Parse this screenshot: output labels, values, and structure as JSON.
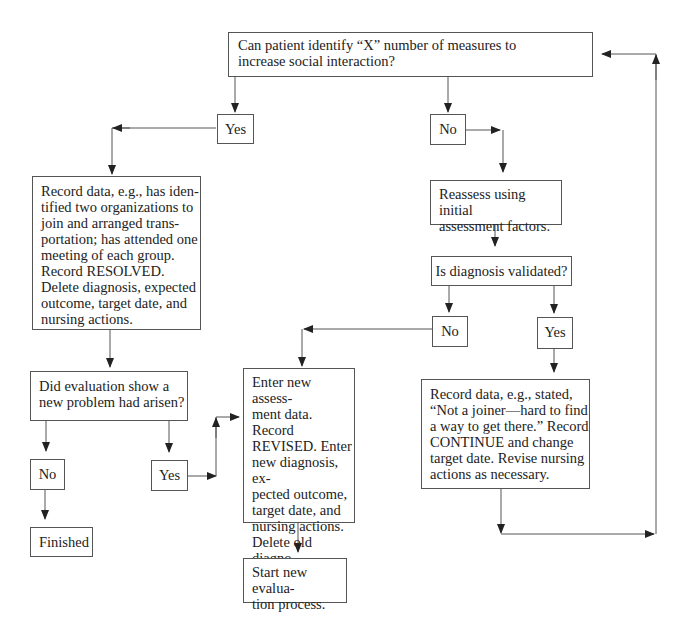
{
  "flowchart": {
    "nodes": {
      "q_identify": {
        "lines": [
          "Can patient identify “X” number of measures to",
          "increase social interaction?"
        ]
      },
      "yes_top": {
        "label": "Yes"
      },
      "no_top": {
        "label": "No"
      },
      "record_resolved": {
        "lines": [
          "Record data, e.g., has iden-",
          "tified two organizations to",
          "join and arranged trans-",
          "portation; has attended one",
          "meeting of each group.",
          "Record RESOLVED.",
          "Delete diagnosis, expected",
          "outcome, target date, and",
          "nursing actions."
        ]
      },
      "reassess": {
        "lines": [
          "Reassess using initial",
          "assessment factors."
        ]
      },
      "q_validated": {
        "label": "Is diagnosis validated?"
      },
      "no_validated": {
        "label": "No"
      },
      "yes_validated": {
        "label": "Yes"
      },
      "q_new_problem": {
        "lines": [
          "Did evaluation show a",
          "new problem had arisen?"
        ]
      },
      "no_new_problem": {
        "label": "No"
      },
      "yes_new_problem": {
        "label": "Yes"
      },
      "finished": {
        "label": "Finished"
      },
      "enter_new_assessment": {
        "lines": [
          "Enter new assess-",
          "ment data. Record",
          "REVISED. Enter",
          "new diagnosis, ex-",
          "pected outcome,",
          "target date, and",
          "nursing actions.",
          "Delete old diagno-",
          "sis."
        ]
      },
      "record_continue": {
        "lines": [
          "Record data, e.g., stated,",
          "“Not a joiner—hard to find",
          "a way to get there.” Record",
          "CONTINUE and change",
          "target date. Revise nursing",
          "actions as necessary."
        ]
      },
      "start_new_evaluation": {
        "lines": [
          "Start new evalua-",
          "tion process."
        ]
      }
    },
    "colors": {
      "line": "#444444",
      "border": "#555555",
      "text": "#222222"
    }
  }
}
